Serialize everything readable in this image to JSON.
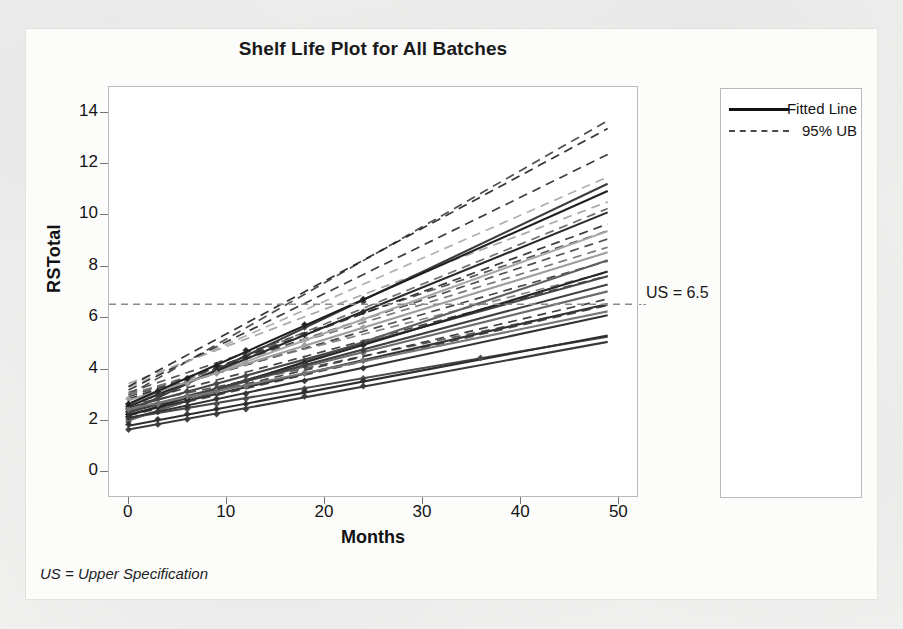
{
  "figure": {
    "footnote": "US = Upper Specification"
  },
  "chart_data": {
    "type": "line",
    "title": "Shelf Life Plot for All Batches",
    "xlabel": "Months",
    "ylabel": "RSTotal",
    "xlim": [
      -2,
      52
    ],
    "ylim": [
      -1,
      15
    ],
    "xticks": [
      0,
      10,
      20,
      30,
      40,
      50
    ],
    "yticks": [
      0,
      2,
      4,
      6,
      8,
      10,
      12,
      14
    ],
    "grid": false,
    "legend_position": "right",
    "spec_limit": {
      "label": "US = 6.5",
      "value": 6.5,
      "style": "dashed",
      "color": "#8a8a8a"
    },
    "legend_lines": [
      {
        "label": "Fitted Line",
        "style": "solid"
      },
      {
        "label": "95% UB",
        "style": "dashed"
      }
    ],
    "legend_group_title": "Batch",
    "series": [
      {
        "name": "1",
        "label": "1",
        "color": "#4a4a4a",
        "intercept": 2.05,
        "slope": 0.065,
        "ub_intercept": 2.55,
        "ub_slope": 0.08,
        "points_x": [
          0,
          0,
          3,
          6,
          9,
          12,
          18,
          24,
          36
        ],
        "points_y": [
          2.0,
          2.1,
          2.3,
          2.4,
          2.6,
          2.8,
          3.2,
          3.6,
          4.4
        ]
      },
      {
        "name": "2",
        "label": "2",
        "color": "#3c3c3c",
        "intercept": 2.3,
        "slope": 0.182,
        "ub_intercept": 2.95,
        "ub_slope": 0.219,
        "points_x": [
          0,
          0,
          3,
          6,
          9,
          12,
          18,
          24
        ],
        "points_y": [
          2.3,
          2.4,
          2.9,
          3.4,
          3.9,
          4.5,
          5.6,
          6.6
        ]
      },
      {
        "name": "3",
        "label": "3",
        "color": "#606060",
        "intercept": 1.95,
        "slope": 0.128,
        "ub_intercept": 2.6,
        "ub_slope": 0.156,
        "points_x": [
          0,
          3,
          6,
          9,
          12,
          18,
          24
        ],
        "points_y": [
          1.9,
          2.3,
          2.7,
          3.1,
          3.5,
          4.2,
          5.0
        ]
      },
      {
        "name": "4",
        "label": "4",
        "color": "#474747",
        "intercept": 2.45,
        "slope": 0.105,
        "ub_intercept": 3.05,
        "ub_slope": 0.129,
        "points_x": [
          0,
          3,
          6,
          9,
          12,
          18,
          24
        ],
        "points_y": [
          2.5,
          2.8,
          3.1,
          3.4,
          3.7,
          4.3,
          5.0
        ]
      },
      {
        "name": "5",
        "label": "5",
        "color": "#353535",
        "intercept": 2.2,
        "slope": 0.088,
        "ub_intercept": 2.8,
        "ub_slope": 0.11,
        "points_x": [
          0,
          3,
          6,
          9,
          12,
          18,
          24
        ],
        "points_y": [
          2.2,
          2.5,
          2.7,
          3.0,
          3.3,
          3.8,
          4.3
        ]
      },
      {
        "name": "6",
        "label": "6",
        "color": "#a8a8a8",
        "intercept": 2.6,
        "slope": 0.138,
        "ub_intercept": 3.25,
        "ub_slope": 0.168,
        "points_x": [
          0,
          3,
          6,
          9,
          12,
          18,
          24
        ],
        "points_y": [
          2.6,
          3.0,
          3.4,
          3.8,
          4.2,
          5.1,
          5.9
        ]
      },
      {
        "name": "7",
        "label": "7",
        "color": "#2e2e2e",
        "intercept": 1.75,
        "slope": 0.072,
        "ub_intercept": 2.3,
        "ub_slope": 0.09,
        "points_x": [
          0,
          3,
          6,
          9,
          12,
          18,
          24
        ],
        "points_y": [
          1.8,
          2.0,
          2.2,
          2.4,
          2.6,
          3.1,
          3.5
        ]
      },
      {
        "name": "8",
        "label": "8",
        "color": "#252525",
        "intercept": 2.15,
        "slope": 0.115,
        "ub_intercept": 2.78,
        "ub_slope": 0.14,
        "points_x": [
          0,
          3,
          6,
          9,
          12,
          18,
          24
        ],
        "points_y": [
          2.2,
          2.5,
          2.8,
          3.2,
          3.5,
          4.2,
          4.9
        ]
      },
      {
        "name": "9",
        "label": "9",
        "color": "#6b6b6b",
        "intercept": 2.35,
        "slope": 0.095,
        "ub_intercept": 2.95,
        "ub_slope": 0.118,
        "points_x": [
          0,
          3,
          6,
          9,
          12,
          18,
          24
        ],
        "points_y": [
          2.4,
          2.6,
          2.9,
          3.2,
          3.5,
          4.1,
          4.6
        ]
      },
      {
        "name": "10",
        "label": "10",
        "color": "#3a3a3a",
        "intercept": 1.6,
        "slope": 0.07,
        "ub_intercept": 2.15,
        "ub_slope": 0.088,
        "points_x": [
          0,
          3,
          6,
          9,
          12,
          18,
          24
        ],
        "points_y": [
          1.6,
          1.8,
          2.0,
          2.2,
          2.4,
          2.9,
          3.3
        ]
      },
      {
        "name": "11",
        "label": "11",
        "color": "#2a2a2a",
        "intercept": 2.5,
        "slope": 0.155,
        "ub_intercept": 3.15,
        "ub_slope": 0.188,
        "points_x": [
          0,
          3,
          6,
          9,
          12,
          18,
          24
        ],
        "points_y": [
          2.5,
          3.0,
          3.4,
          3.9,
          4.4,
          5.3,
          6.2
        ]
      },
      {
        "name": "12",
        "label": "12",
        "color": "#9e9e9e",
        "intercept": 2.75,
        "slope": 0.118,
        "ub_intercept": 3.4,
        "ub_slope": 0.145,
        "points_x": [
          0,
          3,
          6,
          9,
          12,
          18,
          24
        ],
        "points_y": [
          2.8,
          3.1,
          3.4,
          3.8,
          4.2,
          4.9,
          5.6
        ]
      },
      {
        "name": "13",
        "label": "13",
        "color": "#333333",
        "intercept": 2.05,
        "slope": 0.082,
        "ub_intercept": 2.62,
        "ub_slope": 0.102,
        "points_x": [
          0,
          3,
          6,
          9,
          12,
          18,
          24
        ],
        "points_y": [
          2.1,
          2.3,
          2.5,
          2.8,
          3.0,
          3.5,
          4.0
        ]
      },
      {
        "name": "14",
        "label": "14",
        "color": "#404040",
        "intercept": 2.28,
        "slope": 0.102,
        "ub_intercept": 2.88,
        "ub_slope": 0.126,
        "points_x": [
          0,
          3,
          6,
          9,
          12,
          18,
          24
        ],
        "points_y": [
          2.3,
          2.6,
          2.9,
          3.2,
          3.5,
          4.1,
          4.7
        ]
      },
      {
        "name": "15",
        "label": "15",
        "color": "#787878",
        "intercept": 2.4,
        "slope": 0.078,
        "ub_intercept": 3.0,
        "ub_slope": 0.097,
        "points_x": [
          0,
          3,
          6,
          9,
          12,
          18,
          24
        ],
        "points_y": [
          2.4,
          2.6,
          2.9,
          3.1,
          3.3,
          3.8,
          4.3
        ]
      },
      {
        "name": "16",
        "label": "16",
        "color": "#1f1f1f",
        "intercept": 2.6,
        "slope": 0.17,
        "ub_intercept": 3.28,
        "ub_slope": 0.206,
        "points_x": [
          0,
          3,
          6,
          9,
          12,
          18,
          24
        ],
        "points_y": [
          2.6,
          3.1,
          3.6,
          4.1,
          4.7,
          5.7,
          6.7
        ]
      }
    ]
  }
}
